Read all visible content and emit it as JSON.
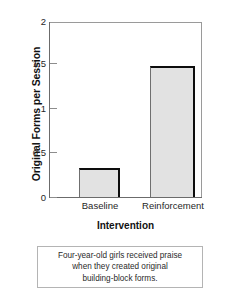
{
  "chart_data": {
    "type": "bar",
    "title": "",
    "xlabel": "Intervention",
    "ylabel": "Original Forms per Session",
    "categories": [
      "Baseline",
      "Reinforcement"
    ],
    "values": [
      0.33,
      1.5
    ],
    "ylim": [
      0,
      2
    ],
    "yticks": [
      0,
      0.5,
      1,
      1.5,
      2
    ],
    "ytick_labels": [
      "0",
      "0.5",
      "1",
      "1.5",
      "2"
    ],
    "grid": false,
    "legend": "none",
    "bar_fill_color": "#e2e2e2",
    "bar_edge_color": "#0d0d0d",
    "frame_color": "#9a9a9a"
  },
  "axis": {
    "y_title": "Original Forms per Session",
    "x_title": "Intervention",
    "tick_labels": {
      "t0": "0",
      "t1": "0.5",
      "t2": "1",
      "t3": "1.5",
      "t4": "2"
    },
    "category_labels": {
      "c0": "Baseline",
      "c1": "Reinforcement"
    }
  },
  "caption": {
    "line1": "Four-year-old girls received praise",
    "line2": "when they created original",
    "line3": "building-block forms."
  }
}
